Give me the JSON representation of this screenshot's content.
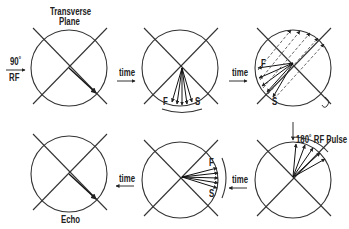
{
  "labels": {
    "transverse_plane_line1": "Transverse",
    "transverse_plane_line2": "Plane",
    "rf_angle": "90˚",
    "rf": "RF",
    "time": "time",
    "fast": "F",
    "slow": "S",
    "pulse_180": "180˚ RF Pulse",
    "echo": "Echo"
  },
  "colors": {
    "stroke": "#333333",
    "dashed": "#555555",
    "background": "#ffffff"
  },
  "steps": [
    {
      "id": 1,
      "description": "Magnetization vector in transverse plane after 90° RF pulse"
    },
    {
      "id": 2,
      "description": "Spins begin to dephase, fast and slow components fan out"
    },
    {
      "id": 3,
      "description": "Spins dephased further; dashed arrows show 180° flip"
    },
    {
      "id": 4,
      "description": "After 180° RF pulse, spin positions inverted"
    },
    {
      "id": 5,
      "description": "Spins rephasing, fast catching slow"
    },
    {
      "id": 6,
      "description": "Spins rephased forming echo"
    }
  ]
}
